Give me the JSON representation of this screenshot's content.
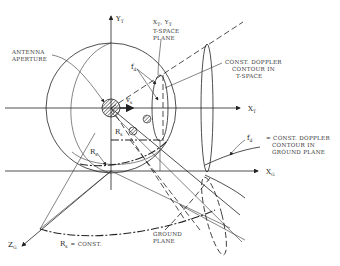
{
  "diagram": {
    "axes": {
      "y_t": {
        "main": "Y",
        "sub": "T"
      },
      "x_t": {
        "main": "X",
        "sub": "T"
      },
      "x_g": {
        "main": "X",
        "sub": "G"
      },
      "z_g": {
        "main": "Z",
        "sub": "G"
      }
    },
    "labels": {
      "antenna_line1": "ANTENNA",
      "antenna_line2": "APERTURE",
      "tspace_line1": "X",
      "tspace_sub1": "T",
      "tspace_mid": ", Y",
      "tspace_sub2": "T",
      "tspace_line2": "T-SPACE",
      "tspace_line3": "PLANE",
      "doppler_t_line1": "CONST. DOPPLER",
      "doppler_t_line2": "CONTOUR IN",
      "doppler_t_line3": "T-SPACE",
      "fd_upper": "f",
      "fd_upper_sub": "d",
      "fd_right": "f",
      "fd_right_sub": "d",
      "doppler_g_line1": "= CONST. DOPPLER",
      "doppler_g_line2": "CONTOUR IN",
      "doppler_g_line3": "GROUND PLANE",
      "vs": "v",
      "vs_sub": "s",
      "rs_mid": "R",
      "rs_mid_sub": "s",
      "rs_left": "R",
      "rs_left_sub": "s",
      "rs_const": "R",
      "rs_const_sub": "s",
      "rs_const_text": "= CONST.",
      "ground_line1": "GROUND",
      "ground_line2": "PLANE"
    }
  }
}
